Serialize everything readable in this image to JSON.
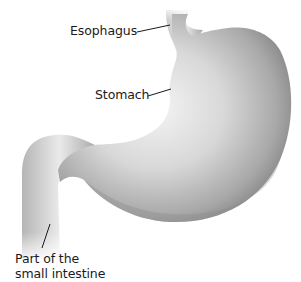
{
  "diagram": {
    "labels": {
      "esophagus": "Esophagus",
      "stomach": "Stomach",
      "intestine_line1": "Part of the",
      "intestine_line2": "small intestine"
    },
    "colors": {
      "background": "#ffffff",
      "organ_light": "#f2f2f2",
      "organ_mid": "#bdbdbd",
      "organ_dark": "#7a7a7a",
      "leader_line": "#1a1a1a",
      "text": "#1a1a1a"
    }
  }
}
